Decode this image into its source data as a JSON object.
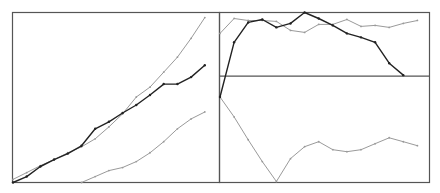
{
  "colors": {
    "background": "#ffffff",
    "frame": "#555555",
    "zero_line": "#555555",
    "dark_series": "#222222",
    "light_series": "#9a9a9a"
  },
  "chart_data": [
    {
      "type": "line",
      "title": "",
      "xlabel": "",
      "ylabel": "",
      "grid": false,
      "legend": null,
      "x": [
        0,
        1,
        2,
        3,
        4,
        5,
        6,
        7,
        8,
        9,
        10,
        11,
        12,
        13,
        14
      ],
      "xlim": [
        0,
        14.2
      ],
      "ylim": [
        0,
        100
      ],
      "series": [
        {
          "name": "series-dark",
          "style": "dark",
          "values": [
            0,
            3.5,
            9.4,
            13.5,
            17,
            21.6,
            31.6,
            35.7,
            40.9,
            45.6,
            51.5,
            57.9,
            57.9,
            62,
            69
          ]
        },
        {
          "name": "series-light-upper",
          "style": "light",
          "values": [
            1.8,
            5.8,
            9.9,
            13.5,
            17.5,
            21,
            25.7,
            32.7,
            40.4,
            50.3,
            56.1,
            64.9,
            73.7,
            84.8,
            97
          ]
        },
        {
          "name": "series-light-lower",
          "style": "light",
          "start_index": 5,
          "values": [
            0,
            3.5,
            7,
            8.8,
            12.3,
            17.5,
            24,
            31.6,
            37.4,
            41.5
          ]
        }
      ]
    },
    {
      "type": "line",
      "title": "",
      "xlabel": "",
      "ylabel": "",
      "grid": false,
      "legend": null,
      "zero_line": 0,
      "x": [
        0,
        1,
        2,
        3,
        4,
        5,
        6,
        7,
        8,
        9,
        10,
        11,
        12,
        13,
        14
      ],
      "xlim": [
        0,
        14.8
      ],
      "ylim": [
        -107,
        64
      ],
      "series": [
        {
          "name": "series-dark",
          "style": "dark",
          "values": [
            -21,
            34,
            54,
            57,
            49,
            53,
            64,
            58,
            51,
            43,
            39,
            34,
            13,
            1
          ]
        },
        {
          "name": "series-light-upper",
          "style": "light",
          "values": [
            43,
            58,
            56,
            56,
            55,
            46,
            44,
            52,
            52,
            57,
            50,
            51,
            49,
            53,
            56
          ]
        },
        {
          "name": "series-light-lower",
          "style": "light",
          "values": [
            -21,
            -41,
            -64,
            -86,
            -106,
            -83,
            -71,
            -66,
            -74,
            -76,
            -74,
            -68,
            -62,
            -66,
            -70
          ]
        }
      ]
    }
  ]
}
